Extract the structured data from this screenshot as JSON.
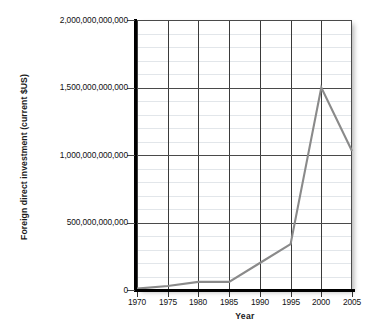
{
  "chart_data": {
    "type": "line",
    "title": "",
    "xlabel": "Year",
    "ylabel": "Foreign direct investment (current $US)",
    "x": [
      1970,
      1975,
      1980,
      1985,
      1990,
      1995,
      2000,
      2005
    ],
    "values": [
      10000000000,
      30000000000,
      60000000000,
      60000000000,
      200000000000,
      340000000000,
      1500000000000,
      1030000000000
    ],
    "series": [
      {
        "name": "Foreign direct investment",
        "values": [
          10000000000,
          30000000000,
          60000000000,
          60000000000,
          200000000000,
          340000000000,
          1500000000000,
          1030000000000
        ]
      }
    ],
    "xlim": [
      1970,
      2005
    ],
    "ylim": [
      0,
      2000000000000
    ],
    "ytick_values": [
      0,
      500000000000,
      1000000000000,
      1500000000000,
      2000000000000
    ],
    "ytick_labels": [
      "0",
      "500,000,000,000",
      "1,000,000,000,000",
      "1,500,000,000,000",
      "2,000,000,000,000"
    ],
    "xtick_labels": [
      "1970",
      "1975",
      "1980",
      "1985",
      "1990",
      "1995",
      "2000",
      "2005"
    ],
    "minor_y_step": 100000000000,
    "grid": true,
    "legend": false,
    "legend_position": "none",
    "line_color": "#8a8a8a",
    "axis_color": "#000000",
    "major_grid_color": "#4a4a4a",
    "minor_grid_color": "#e2e6ea",
    "vertical_grid_color": "#3a3a3a"
  }
}
